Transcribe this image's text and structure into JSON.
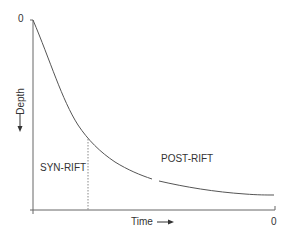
{
  "diagram": {
    "title": "",
    "y_axis": {
      "label": "Depth",
      "arrow": "down-arrow-icon",
      "top_tick_label": "0"
    },
    "x_axis": {
      "label": "Time",
      "arrow": "right-arrow-icon",
      "right_tick_label": "0"
    },
    "regions": {
      "syn_rift": "SYN-RIFT",
      "post_rift": "POST-RIFT"
    },
    "colors": {
      "line": "#555555",
      "text": "#333333",
      "divider": "#888888"
    }
  }
}
